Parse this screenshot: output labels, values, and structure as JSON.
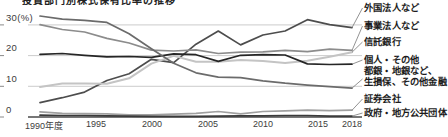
{
  "cropped_title": "投資部門別株式保有比率の推移",
  "y_axis": {
    "labels": [
      "30(%)",
      "20",
      "10",
      "0"
    ],
    "values": [
      30,
      20,
      10,
      0
    ]
  },
  "x_axis": {
    "labels": [
      "1990年度",
      "1995",
      "2000",
      "2005",
      "2010",
      "2015",
      "2018"
    ],
    "years": [
      1990,
      1995,
      2000,
      2005,
      2010,
      2015,
      2018
    ]
  },
  "legend": {
    "items": [
      {
        "label": "外国法人など"
      },
      {
        "label": "事業法人など"
      },
      {
        "label": "信託銀行"
      },
      {
        "label": "個人・その他"
      },
      {
        "label": "都銀・地銀など、",
        "label2": "生損保、その他金融"
      },
      {
        "label": "証券会社"
      },
      {
        "label": "政府・地方公共団体"
      }
    ]
  },
  "chart_data": {
    "type": "line",
    "title": "投資部門別株式保有比率の推移",
    "xlabel": "年度",
    "ylabel": "%",
    "ylim": [
      0,
      35
    ],
    "y_ticks": [
      0,
      10,
      20,
      30
    ],
    "x_tick_years": [
      1990,
      1995,
      2000,
      2005,
      2010,
      2015,
      2018
    ],
    "grid": "horizontal",
    "legend_position": "right",
    "x": [
      1990,
      1992,
      1994,
      1996,
      1998,
      2000,
      2002,
      2004,
      2006,
      2008,
      2010,
      2012,
      2014,
      2016,
      2018
    ],
    "series": [
      {
        "id": "foreign",
        "name": "外国法人など",
        "color": "#4d4d4d",
        "values": [
          4.7,
          6.3,
          8.1,
          11.9,
          14.1,
          18.8,
          17.7,
          23.7,
          28.0,
          23.5,
          26.7,
          28.0,
          31.7,
          30.1,
          29.1
        ]
      },
      {
        "id": "business",
        "name": "事業法人など",
        "color": "#8c8c8c",
        "values": [
          30.1,
          28.5,
          27.7,
          25.6,
          24.1,
          21.8,
          21.5,
          21.9,
          20.7,
          21.1,
          21.2,
          21.7,
          21.3,
          22.1,
          21.7
        ]
      },
      {
        "id": "trust-banks",
        "name": "信託銀行",
        "color": "#c4c4c4",
        "values": [
          9.8,
          10.9,
          10.9,
          10.8,
          12.6,
          17.4,
          19.9,
          18.0,
          18.0,
          18.6,
          18.2,
          17.6,
          18.3,
          19.6,
          21.1
        ]
      },
      {
        "id": "individuals",
        "name": "個人・その他",
        "color": "#262626",
        "values": [
          20.4,
          20.7,
          20.1,
          19.6,
          19.7,
          19.4,
          20.6,
          20.3,
          18.1,
          20.1,
          20.3,
          20.2,
          17.3,
          17.1,
          17.2
        ]
      },
      {
        "id": "banks-insurance",
        "name": "都銀・地銀など、生損保、その他金融",
        "color": "#6b6b6b",
        "values": [
          32.9,
          31.9,
          31.5,
          30.8,
          27.1,
          22.2,
          17.5,
          14.4,
          13.0,
          12.8,
          11.8,
          11.0,
          10.4,
          9.9,
          9.4
        ]
      },
      {
        "id": "securities",
        "name": "証券会社",
        "color": "#a0a0a0",
        "values": [
          1.7,
          1.2,
          1.1,
          1.0,
          0.7,
          0.7,
          0.9,
          1.2,
          1.8,
          1.0,
          1.8,
          2.0,
          2.2,
          2.1,
          2.2
        ]
      },
      {
        "id": "government",
        "name": "政府・地方公共団体",
        "color": "#3a3a3a",
        "values": [
          0.6,
          0.5,
          0.5,
          0.4,
          0.3,
          0.2,
          0.2,
          0.2,
          0.3,
          0.4,
          0.4,
          0.5,
          0.5,
          0.3,
          0.3
        ]
      }
    ]
  }
}
